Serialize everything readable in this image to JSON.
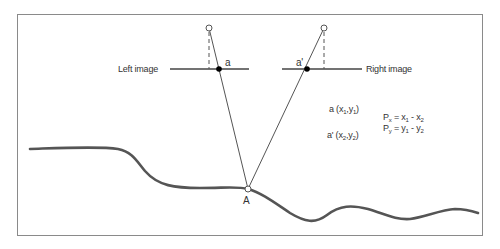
{
  "diagram": {
    "type": "stereo-parallax-geometry",
    "labels": {
      "left_image": "Left image",
      "right_image": "Right image",
      "point_a": "a",
      "point_a_prime": "a'",
      "ground_point": "A"
    },
    "coordinates": {
      "a_label": "a (x",
      "a_sub1": "1",
      "a_mid": ",y",
      "a_sub2": "1",
      "a_end": ")",
      "ap_label": "a' (x",
      "ap_sub1": "2",
      "ap_mid": ",y",
      "ap_sub2": "2",
      "ap_end": ")"
    },
    "equations": {
      "px_P": "P",
      "px_sub": "x",
      "px_rhs": " = x",
      "px_rhs_sub1": "1",
      "px_minus": " - x",
      "px_rhs_sub2": "2",
      "py_P": "P",
      "py_sub": "y",
      "py_rhs": " = y",
      "py_rhs_sub1": "1",
      "py_minus": " - y",
      "py_rhs_sub2": "2"
    },
    "colors": {
      "frame": "#8a8a8a",
      "lines": "#444444",
      "terrain": "#555555",
      "text": "#333333"
    }
  }
}
